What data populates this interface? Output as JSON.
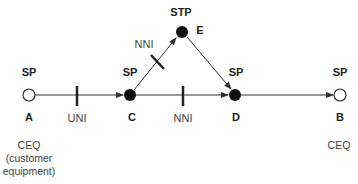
{
  "nodes": [
    {
      "id": "A",
      "type": "SP",
      "filled": false,
      "x": 29,
      "y": 95
    },
    {
      "id": "C",
      "type": "SP",
      "filled": true,
      "x": 130,
      "y": 95
    },
    {
      "id": "E",
      "type": "STP",
      "filled": true,
      "x": 182,
      "y": 32
    },
    {
      "id": "D",
      "type": "SP",
      "filled": true,
      "x": 235,
      "y": 95
    },
    {
      "id": "B",
      "type": "SP",
      "filled": false,
      "x": 340,
      "y": 95
    }
  ],
  "labels": {
    "A_type": "SP",
    "A_id": "A",
    "C_type": "SP",
    "C_id": "C",
    "E_type": "STP",
    "E_id": "E",
    "D_type": "SP",
    "D_id": "D",
    "B_type": "SP",
    "B_id": "B",
    "uni": "UNI",
    "nni_ce": "NNI",
    "nni_cd": "NNI",
    "ceq_a_line1": "CEQ",
    "ceq_a_line2": "(customer",
    "ceq_a_line3": "equipment)",
    "ceq_b": "CEQ"
  },
  "edges": [
    {
      "from": "A",
      "to": "C",
      "interface": "UNI"
    },
    {
      "from": "C",
      "to": "E",
      "interface": "NNI"
    },
    {
      "from": "C",
      "to": "D",
      "interface": "NNI"
    },
    {
      "from": "E",
      "to": "D",
      "interface": ""
    },
    {
      "from": "D",
      "to": "B",
      "interface": ""
    }
  ],
  "colors": {
    "line": "#333333",
    "node_fill": "#111111",
    "text": "#222222"
  }
}
